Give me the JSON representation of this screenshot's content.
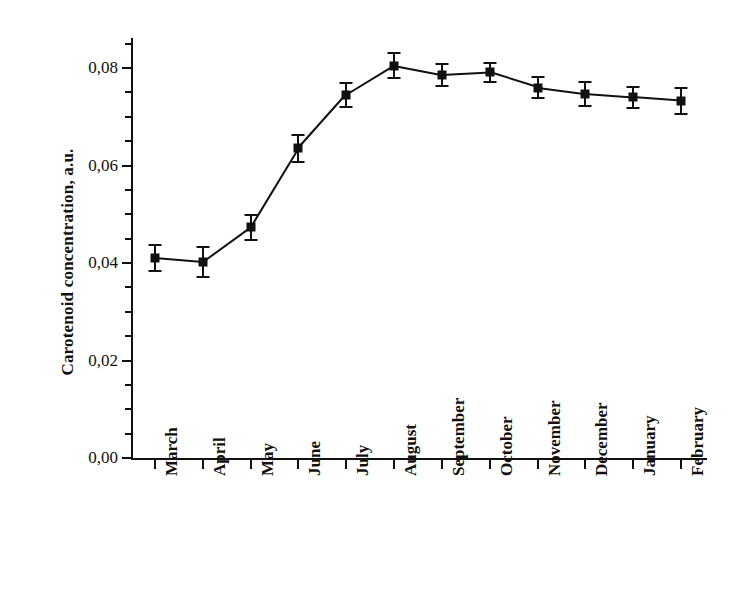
{
  "chart_data": {
    "type": "line",
    "title": "",
    "xlabel": "",
    "ylabel": "Carotenoid concentration, a.u.",
    "categories": [
      "March",
      "April",
      "May",
      "June",
      "July",
      "August",
      "September",
      "October",
      "November",
      "December",
      "January",
      "February"
    ],
    "values": [
      0.041,
      0.0402,
      0.0473,
      0.0635,
      0.0745,
      0.0805,
      0.0786,
      0.0791,
      0.076,
      0.0747,
      0.074,
      0.0733
    ],
    "errors": [
      0.0027,
      0.003,
      0.0026,
      0.0028,
      0.0025,
      0.0025,
      0.0022,
      0.002,
      0.0022,
      0.0025,
      0.0022,
      0.0027
    ],
    "ylim": [
      0.0,
      0.0853
    ],
    "y_major_ticks": [
      0.0,
      0.02,
      0.04,
      0.06,
      0.08
    ],
    "y_major_tick_labels": [
      "0,00",
      "0,02",
      "0,04",
      "0,06",
      "0,08"
    ],
    "y_minor_tick_step": 0.005,
    "grid": false,
    "legend": null,
    "marker": "square",
    "error_bars": "symmetric-vertical-with-caps",
    "spines": [
      "left",
      "bottom"
    ],
    "tick_direction": "out",
    "decimal_separator": ","
  }
}
